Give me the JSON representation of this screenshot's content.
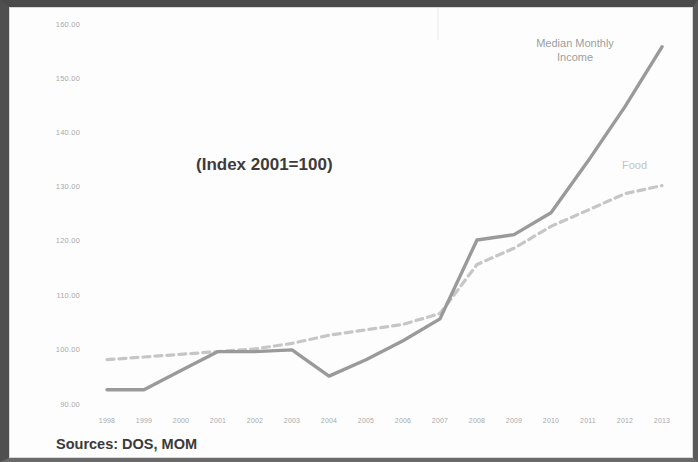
{
  "figure": {
    "index_note": "(Index 2001=100)",
    "source_note": "Sources: DOS, MOM",
    "label_income": "Median Monthly\nIncome",
    "label_income_line1": "Median Monthly",
    "label_income_line2": "Income",
    "label_food": "Food"
  },
  "colors": {
    "income_line": "#9a9a9a",
    "food_line": "#c6c6c6",
    "axis_text": "#a9a9a9",
    "note_text": "#3a3a3a",
    "frame": "#4f4f4f",
    "background": "#ffffff"
  },
  "chart_data": {
    "type": "line",
    "title": "(Index 2001=100)",
    "subtitle": "",
    "xlabel": "",
    "ylabel": "",
    "xlim": [
      1998,
      2013
    ],
    "ylim": [
      90,
      160
    ],
    "ytick_labels": [
      "160.00",
      "150.00",
      "140.00",
      "130.00",
      "120.00",
      "110.00",
      "100.00",
      "90.00"
    ],
    "yticks": [
      160,
      150,
      140,
      130,
      120,
      110,
      100,
      90
    ],
    "grid": false,
    "legend_position": "inline-annotations",
    "annotations": [
      "(Index 2001=100)",
      "Median Monthly Income",
      "Food",
      "Sources: DOS, MOM"
    ],
    "categories": [
      1998,
      1999,
      2000,
      2001,
      2002,
      2003,
      2004,
      2005,
      2006,
      2007,
      2008,
      2009,
      2010,
      2011,
      2012,
      2013
    ],
    "xtick_labels": [
      "1998",
      "1999",
      "2000",
      "2001",
      "2002",
      "2003",
      "2004",
      "2005",
      "2006",
      "2007",
      "2008",
      "2009",
      "2010",
      "2011",
      "2012",
      "2013"
    ],
    "series": [
      {
        "name": "Median Monthly Income",
        "style": "solid",
        "color": "#9a9a9a",
        "values": [
          93.0,
          93.0,
          96.5,
          100.0,
          100.0,
          100.3,
          95.5,
          98.5,
          102.0,
          106.0,
          120.5,
          121.5,
          125.5,
          135.0,
          145.0,
          156.0
        ]
      },
      {
        "name": "Food",
        "style": "dashed",
        "color": "#c6c6c6",
        "values": [
          98.5,
          99.0,
          99.5,
          100.0,
          100.5,
          101.5,
          103.0,
          104.0,
          105.0,
          107.0,
          116.0,
          119.0,
          123.0,
          126.0,
          129.0,
          130.5
        ]
      }
    ]
  }
}
